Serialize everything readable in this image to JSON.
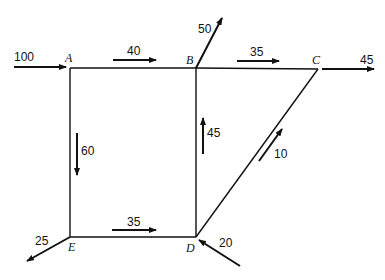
{
  "diagram": {
    "type": "flow-network",
    "nodes": [
      {
        "id": "A",
        "label": "A"
      },
      {
        "id": "B",
        "label": "B"
      },
      {
        "id": "C",
        "label": "C"
      },
      {
        "id": "D",
        "label": "D"
      },
      {
        "id": "E",
        "label": "E"
      }
    ],
    "edges": [
      {
        "from": "A",
        "to": "B",
        "flow": "40"
      },
      {
        "from": "B",
        "to": "C",
        "flow": "35"
      },
      {
        "from": "A",
        "to": "E",
        "flow": "60"
      },
      {
        "from": "E",
        "to": "D",
        "flow": "35"
      },
      {
        "from": "D",
        "to": "B",
        "flow": "45"
      },
      {
        "from": "D",
        "to": "C",
        "flow": "10"
      }
    ],
    "external": [
      {
        "node": "A",
        "direction": "in",
        "flow": "100"
      },
      {
        "node": "B",
        "direction": "out",
        "flow": "50"
      },
      {
        "node": "C",
        "direction": "out",
        "flow": "45"
      },
      {
        "node": "D",
        "direction": "in",
        "flow": "20"
      },
      {
        "node": "E",
        "direction": "out",
        "flow": "25"
      }
    ]
  }
}
